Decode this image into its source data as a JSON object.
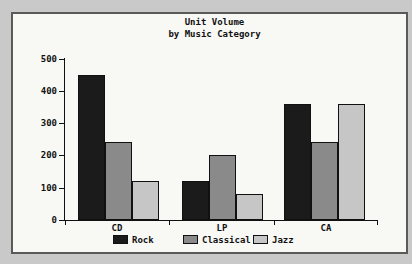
{
  "title": {
    "line1": "Unit Volume",
    "line2": "by Music Category"
  },
  "chart_data": {
    "type": "bar",
    "title": "Unit Volume by Music Category",
    "categories": [
      "CD",
      "LP",
      "CA"
    ],
    "series": [
      {
        "name": "Rock",
        "color": "#1b1b1b",
        "values": [
          450,
          120,
          360
        ]
      },
      {
        "name": "Classical",
        "color": "#8a8a8a",
        "values": [
          240,
          200,
          240
        ]
      },
      {
        "name": "Jazz",
        "color": "#c6c6c6",
        "values": [
          120,
          80,
          360
        ]
      }
    ],
    "xlabel": "",
    "ylabel": "",
    "ylim": [
      0,
      500
    ],
    "ytick_interval": 100,
    "ytick_labels": [
      "0",
      "100",
      "200",
      "300",
      "400",
      "500"
    ],
    "grid": false,
    "legend": {
      "position": "bottom",
      "entries": [
        "Rock",
        "Classical",
        "Jazz"
      ]
    }
  },
  "colors": {
    "outer_background": "#c9c9c9",
    "plot_background": "#f8f8f5",
    "frame_border": "#5a5a5a",
    "axis": "#111111",
    "text": "#111111"
  }
}
